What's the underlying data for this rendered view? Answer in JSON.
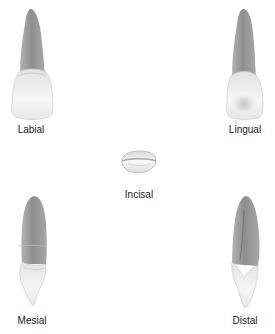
{
  "figure": {
    "views": [
      {
        "id": "labial",
        "label": "Labial"
      },
      {
        "id": "lingual",
        "label": "Lingual"
      },
      {
        "id": "incisal",
        "label": "Incisal"
      },
      {
        "id": "mesial",
        "label": "Mesial"
      },
      {
        "id": "distal",
        "label": "Distal"
      }
    ]
  },
  "colors": {
    "root": "#9a9a9a",
    "root_dark": "#7d7d7d",
    "crown": "#efefef",
    "crown_shadow": "#cfcfcf",
    "background": "#ffffff"
  }
}
